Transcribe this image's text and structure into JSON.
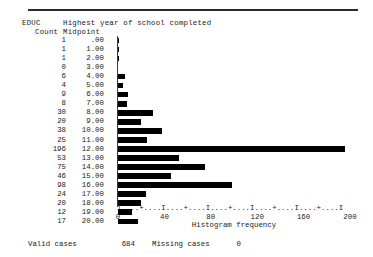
{
  "header": {
    "variable": "EDUC",
    "title": "Highest year of school completed",
    "count_label": "Count",
    "midpoint_label": "Midpoint"
  },
  "axis": {
    "ascii": "I....+....I....+....I....+....I....+....I....+....I",
    "title": "Histogram frequency",
    "ticks": [
      0,
      40,
      80,
      120,
      160,
      200
    ],
    "tick_labels": [
      "0",
      "40",
      "80",
      "120",
      "160",
      "200"
    ],
    "min": 0,
    "max": 200
  },
  "footer": {
    "valid_label": "Valid cases",
    "valid_value": "684",
    "missing_label": "Missing cases",
    "missing_value": "0"
  },
  "chart_data": {
    "type": "bar",
    "orientation": "horizontal",
    "title": "Highest year of school completed",
    "xlabel": "Histogram frequency",
    "ylabel": "Midpoint",
    "xlim": [
      0,
      200
    ],
    "grid": false,
    "legend": null,
    "categories": [
      ".00",
      "1.00",
      "2.00",
      "3.00",
      "4.00",
      "5.00",
      "6.00",
      "7.00",
      "8.00",
      "9.00",
      "10.00",
      "11.00",
      "12.00",
      "13.00",
      "14.00",
      "15.00",
      "16.00",
      "17.00",
      "18.00",
      "19.00",
      "20.00"
    ],
    "values": [
      1,
      1,
      1,
      0,
      6,
      4,
      9,
      8,
      30,
      20,
      38,
      25,
      196,
      53,
      75,
      46,
      98,
      24,
      20,
      12,
      17
    ],
    "rows": [
      {
        "count": "1",
        "midpoint": ".00",
        "value": 1
      },
      {
        "count": "1",
        "midpoint": "1.00",
        "value": 1
      },
      {
        "count": "1",
        "midpoint": "2.00",
        "value": 1
      },
      {
        "count": "0",
        "midpoint": "3.00",
        "value": 0
      },
      {
        "count": "6",
        "midpoint": "4.00",
        "value": 6
      },
      {
        "count": "4",
        "midpoint": "5.00",
        "value": 4
      },
      {
        "count": "9",
        "midpoint": "6.00",
        "value": 9
      },
      {
        "count": "8",
        "midpoint": "7.00",
        "value": 8
      },
      {
        "count": "30",
        "midpoint": "8.00",
        "value": 30
      },
      {
        "count": "20",
        "midpoint": "9.00",
        "value": 20
      },
      {
        "count": "38",
        "midpoint": "10.00",
        "value": 38
      },
      {
        "count": "25",
        "midpoint": "11.00",
        "value": 25
      },
      {
        "count": "196",
        "midpoint": "12.00",
        "value": 196
      },
      {
        "count": "53",
        "midpoint": "13.00",
        "value": 53
      },
      {
        "count": "75",
        "midpoint": "14.00",
        "value": 75
      },
      {
        "count": "46",
        "midpoint": "15.00",
        "value": 46
      },
      {
        "count": "98",
        "midpoint": "16.00",
        "value": 98
      },
      {
        "count": "24",
        "midpoint": "17.00",
        "value": 24
      },
      {
        "count": "20",
        "midpoint": "18.00",
        "value": 20
      },
      {
        "count": "12",
        "midpoint": "19.00",
        "value": 12
      },
      {
        "count": "17",
        "midpoint": "20.00",
        "value": 17
      }
    ],
    "total_valid": 684,
    "total_missing": 0
  }
}
